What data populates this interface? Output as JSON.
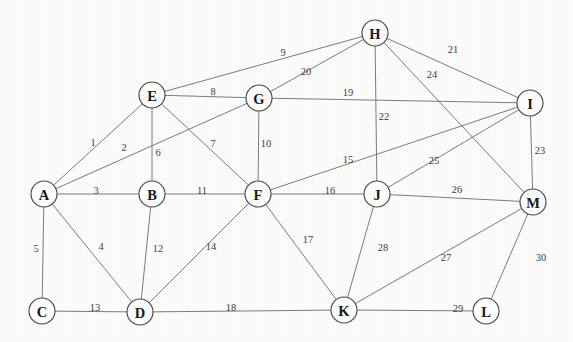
{
  "figure": {
    "kind": "undirected-weighted-graph",
    "title": "",
    "background_color": "#fdfdfd",
    "node_fill_color": "#ffffff",
    "node_stroke_color": "#4a4a4a",
    "edge_color": "#6d6d6d",
    "label_color": "#3d3d3d",
    "node_count": 13,
    "edge_count": 30
  },
  "chart_data": {
    "type": "diagram",
    "title": "",
    "xlabel": "",
    "ylabel": "",
    "nodes": [
      {
        "id": "A",
        "label": "A",
        "x": 44,
        "y": 194,
        "r": 13
      },
      {
        "id": "B",
        "label": "B",
        "x": 152,
        "y": 194,
        "r": 13
      },
      {
        "id": "C",
        "label": "C",
        "x": 42,
        "y": 311,
        "r": 13
      },
      {
        "id": "D",
        "label": "D",
        "x": 140,
        "y": 312,
        "r": 13
      },
      {
        "id": "E",
        "label": "E",
        "x": 152,
        "y": 95,
        "r": 13
      },
      {
        "id": "F",
        "label": "F",
        "x": 258,
        "y": 194,
        "r": 13
      },
      {
        "id": "G",
        "label": "G",
        "x": 259,
        "y": 98,
        "r": 13
      },
      {
        "id": "H",
        "label": "H",
        "x": 375,
        "y": 33,
        "r": 13
      },
      {
        "id": "I",
        "label": "I",
        "x": 530,
        "y": 103,
        "r": 13
      },
      {
        "id": "J",
        "label": "J",
        "x": 377,
        "y": 194,
        "r": 13
      },
      {
        "id": "K",
        "label": "K",
        "x": 344,
        "y": 310,
        "r": 13
      },
      {
        "id": "L",
        "label": "L",
        "x": 486,
        "y": 311,
        "r": 13
      },
      {
        "id": "M",
        "label": "M",
        "x": 533,
        "y": 202,
        "r": 13
      }
    ],
    "edges": [
      {
        "id": 1,
        "label": "1",
        "from": "A",
        "to": "E",
        "lx": 93,
        "ly": 142
      },
      {
        "id": 2,
        "label": "2",
        "from": "A",
        "to": "G",
        "lx": 124,
        "ly": 147
      },
      {
        "id": 3,
        "label": "3",
        "from": "A",
        "to": "B",
        "lx": 96,
        "ly": 190
      },
      {
        "id": 4,
        "label": "4",
        "from": "A",
        "to": "D",
        "lx": 101,
        "ly": 246
      },
      {
        "id": 5,
        "label": "5",
        "from": "A",
        "to": "C",
        "lx": 36,
        "ly": 248
      },
      {
        "id": 6,
        "label": "6",
        "from": "E",
        "to": "B",
        "lx": 158,
        "ly": 152
      },
      {
        "id": 7,
        "label": "7",
        "from": "E",
        "to": "F",
        "lx": 213,
        "ly": 143
      },
      {
        "id": 8,
        "label": "8",
        "from": "E",
        "to": "G",
        "lx": 213,
        "ly": 91
      },
      {
        "id": 9,
        "label": "9",
        "from": "E",
        "to": "H",
        "lx": 283,
        "ly": 52
      },
      {
        "id": 10,
        "label": "10",
        "from": "G",
        "to": "F",
        "lx": 266,
        "ly": 143
      },
      {
        "id": 11,
        "label": "11",
        "from": "B",
        "to": "F",
        "lx": 202,
        "ly": 190
      },
      {
        "id": 12,
        "label": "12",
        "from": "B",
        "to": "D",
        "lx": 158,
        "ly": 248
      },
      {
        "id": 13,
        "label": "13",
        "from": "C",
        "to": "D",
        "lx": 95,
        "ly": 307
      },
      {
        "id": 14,
        "label": "14",
        "from": "F",
        "to": "D",
        "lx": 211,
        "ly": 246
      },
      {
        "id": 15,
        "label": "15",
        "from": "F",
        "to": "I",
        "lx": 348,
        "ly": 159
      },
      {
        "id": 16,
        "label": "16",
        "from": "F",
        "to": "J",
        "lx": 330,
        "ly": 190
      },
      {
        "id": 17,
        "label": "17",
        "from": "F",
        "to": "K",
        "lx": 308,
        "ly": 239
      },
      {
        "id": 18,
        "label": "18",
        "from": "D",
        "to": "K",
        "lx": 231,
        "ly": 307
      },
      {
        "id": 19,
        "label": "19",
        "from": "G",
        "to": "I",
        "lx": 348,
        "ly": 92
      },
      {
        "id": 20,
        "label": "20",
        "from": "G",
        "to": "H",
        "lx": 306,
        "ly": 71
      },
      {
        "id": 21,
        "label": "21",
        "from": "H",
        "to": "I",
        "lx": 453,
        "ly": 49
      },
      {
        "id": 22,
        "label": "22",
        "from": "H",
        "to": "J",
        "lx": 384,
        "ly": 116
      },
      {
        "id": 23,
        "label": "23",
        "from": "I",
        "to": "M",
        "lx": 540,
        "ly": 150
      },
      {
        "id": 24,
        "label": "24",
        "from": "H",
        "to": "M",
        "lx": 432,
        "ly": 74
      },
      {
        "id": 25,
        "label": "25",
        "from": "J",
        "to": "I",
        "lx": 434,
        "ly": 160
      },
      {
        "id": 26,
        "label": "26",
        "from": "J",
        "to": "M",
        "lx": 457,
        "ly": 189
      },
      {
        "id": 27,
        "label": "27",
        "from": "K",
        "to": "M",
        "lx": 446,
        "ly": 257
      },
      {
        "id": 28,
        "label": "28",
        "from": "J",
        "to": "K",
        "lx": 383,
        "ly": 247
      },
      {
        "id": 29,
        "label": "29",
        "from": "K",
        "to": "L",
        "lx": 458,
        "ly": 308
      },
      {
        "id": 30,
        "label": "30",
        "from": "M",
        "to": "L",
        "lx": 541,
        "ly": 257
      }
    ]
  }
}
